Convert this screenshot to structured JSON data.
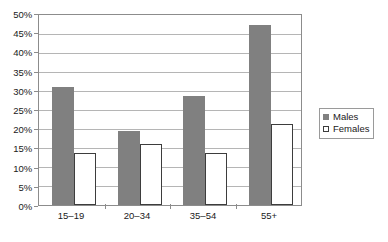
{
  "chart_data": {
    "type": "bar",
    "title": "",
    "subtitle": "",
    "xlabel": "",
    "ylabel": "",
    "categories": [
      "15–19",
      "20–34",
      "35–54",
      "55+"
    ],
    "series": [
      {
        "name": "Males",
        "values": [
          31.0,
          19.5,
          28.8,
          47.3
        ],
        "color": "#808080"
      },
      {
        "name": "Females",
        "values": [
          13.8,
          16.0,
          13.8,
          21.3
        ],
        "color": "#ffffff"
      }
    ],
    "ylim": [
      0,
      50
    ],
    "ytick_values": [
      0,
      5,
      10,
      15,
      20,
      25,
      30,
      35,
      40,
      45,
      50
    ],
    "ytick_labels": [
      "0%",
      "5%",
      "10%",
      "15%",
      "20%",
      "25%",
      "30%",
      "35%",
      "40%",
      "45%",
      "50%"
    ],
    "grid": "horizontal",
    "legend_position": "right",
    "value_format": "percent"
  },
  "axis": {
    "y": {
      "labels": [
        "50%",
        "45%",
        "40%",
        "35%",
        "30%",
        "25%",
        "20%",
        "15%",
        "10%",
        "5%",
        "0%"
      ]
    },
    "x": {
      "labels": [
        "15–19",
        "20–34",
        "35–54",
        "55+"
      ]
    }
  },
  "legend": {
    "items": [
      {
        "label": "Males",
        "swatch": "filled-gray-square"
      },
      {
        "label": "Females",
        "swatch": "hollow-white-square"
      }
    ]
  },
  "colors": {
    "males_fill": "#808080",
    "females_fill": "#ffffff",
    "females_stroke": "#3d3d3d",
    "gridline": "#b5b5b5",
    "axis": "#8c8c8c",
    "text": "#1a1a1a",
    "background": "#ffffff"
  }
}
